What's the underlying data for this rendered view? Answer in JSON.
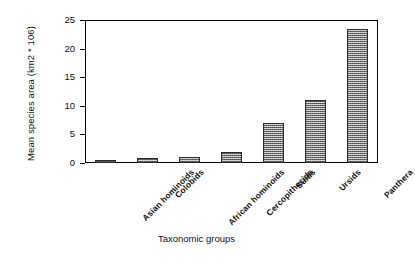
{
  "chart_data": {
    "type": "bar",
    "title": "",
    "xlabel": "Taxonomic groups",
    "ylabel": "Mean species area (km2 * 106)",
    "categories": [
      "Asian hominoids",
      "Colobids",
      "African hominoids",
      "Cercopithecids",
      "Suids",
      "Ursids",
      "Panthera"
    ],
    "values": [
      0.5,
      0.8,
      1.0,
      1.9,
      7.0,
      11.0,
      23.4
    ],
    "ylim": [
      0,
      25
    ],
    "yticks": [
      0,
      5,
      10,
      15,
      20,
      25
    ],
    "ytick_labels": [
      "0",
      "5",
      "10",
      "15",
      "20",
      "25"
    ],
    "grid": false,
    "legend": null,
    "bar_fill_color": "#9a9a9a",
    "bar_edge_color": "#2a2a2a",
    "axis_color": "#000000",
    "background_color": "#ffffff"
  }
}
